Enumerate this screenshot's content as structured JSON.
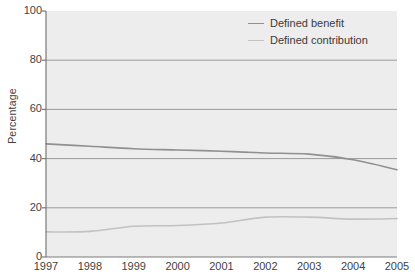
{
  "chart_data": {
    "type": "line",
    "title": "",
    "xlabel": "",
    "ylabel": "Percentage",
    "grid": true,
    "legend_position": "top-right",
    "xlim": [
      1997,
      2005
    ],
    "ylim": [
      0,
      100
    ],
    "x": [
      1997,
      1998,
      1999,
      2000,
      2001,
      2002,
      2003,
      2004,
      2005
    ],
    "xtick_labels": [
      "1997",
      "1998",
      "1999",
      "2000",
      "2001",
      "2002",
      "2003",
      "2004",
      "2005"
    ],
    "ytick_labels": [
      "0",
      "20",
      "40",
      "60",
      "80",
      "100"
    ],
    "yticks": [
      0,
      20,
      40,
      60,
      80,
      100
    ],
    "series": [
      {
        "name": "Defined benefit",
        "color": "#909090",
        "values": [
          46,
          45,
          44,
          43.5,
          43,
          42.3,
          41.8,
          39.5,
          35.5
        ]
      },
      {
        "name": "Defined contribution",
        "color": "#c2c2c2",
        "values": [
          10.2,
          10.4,
          12.5,
          12.8,
          13.8,
          16.2,
          16.2,
          15.4,
          15.6
        ]
      }
    ]
  },
  "style": {
    "plot_background": "#ededed",
    "gridline_color": "#9a9a9a",
    "axis_color": "#7a7a7a",
    "page_background": "#ffffff"
  }
}
